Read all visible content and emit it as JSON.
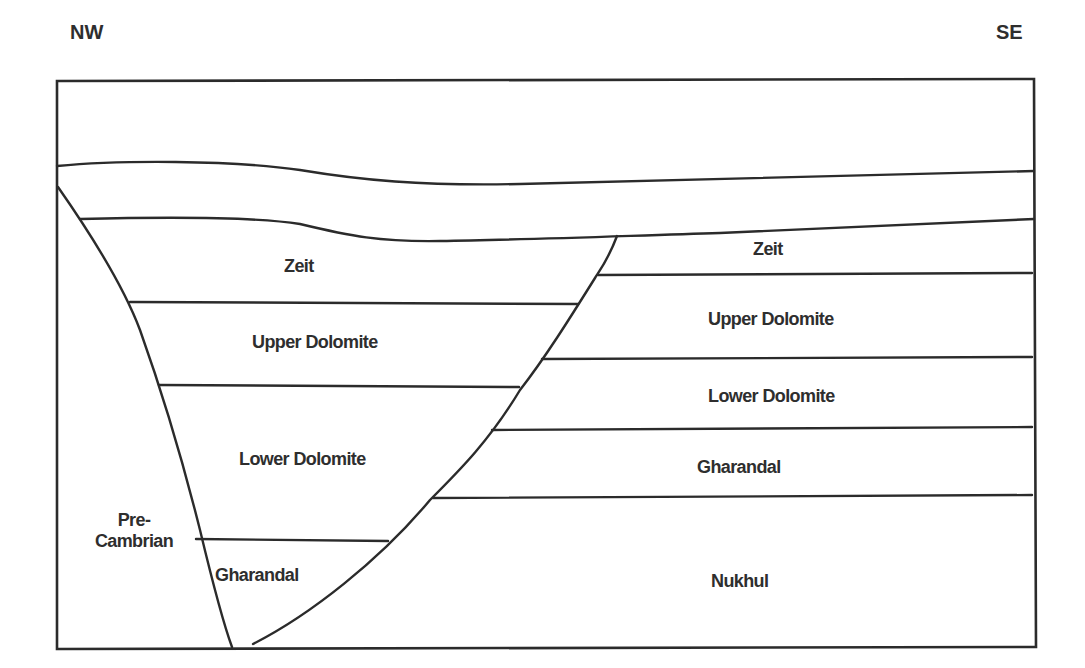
{
  "diagram": {
    "type": "geological cross-section",
    "orientation": {
      "left": "NW",
      "right": "SE"
    },
    "graben_block": {
      "layers": [
        {
          "name": "Zeit"
        },
        {
          "name": "Upper Dolomite"
        },
        {
          "name": "Lower Dolomite"
        },
        {
          "name": "Gharandal"
        }
      ]
    },
    "footwall_block": {
      "label": "Pre-\nCambrian",
      "label_line1": "Pre-",
      "label_line2": "Cambrian"
    },
    "se_block": {
      "layers": [
        {
          "name": "Zeit"
        },
        {
          "name": "Upper Dolomite"
        },
        {
          "name": "Lower Dolomite"
        },
        {
          "name": "Gharandal"
        },
        {
          "name": "Nukhul"
        }
      ]
    },
    "colors": {
      "line": "#2b2b2b",
      "text": "#2e2e2e",
      "background": "#ffffff"
    }
  }
}
